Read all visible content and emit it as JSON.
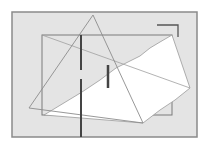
{
  "diagram": {
    "background": "#ffffff",
    "frame": {
      "x": 12,
      "y": 12,
      "w": 185,
      "h": 125,
      "fill": "#e4e4e4",
      "stroke": "#8a8a8a"
    },
    "inner_rect": {
      "x": 42,
      "y": 35,
      "w": 130,
      "h": 80,
      "stroke": "#7a7a7a"
    },
    "white_polygon": {
      "points": "44,115 82,92 100,80 116,68 128,62 140,56 150,48 160,42 172,35 190,88 175,100 160,110 143,123",
      "fill": "#ffffff",
      "stroke": "#9a9a9a"
    },
    "triangle": {
      "points": "93,15 29,108 143,123",
      "stroke": "#8c8c8c"
    },
    "cross_line": {
      "x1": 42,
      "y1": 35,
      "x2": 190,
      "y2": 88,
      "stroke": "#a0a0a0"
    },
    "thick_line_long": {
      "x1": 81,
      "y1": 35,
      "x2": 81,
      "y2": 137,
      "gap_top": 70,
      "gap_bottom": 79,
      "stroke": "#444444"
    },
    "thick_line_short": {
      "x1": 108,
      "y1": 65,
      "x2": 108,
      "y2": 88,
      "stroke": "#444444"
    },
    "corner_bracket": {
      "points": "157,25 178,25 178,37",
      "stroke": "#555555"
    }
  }
}
